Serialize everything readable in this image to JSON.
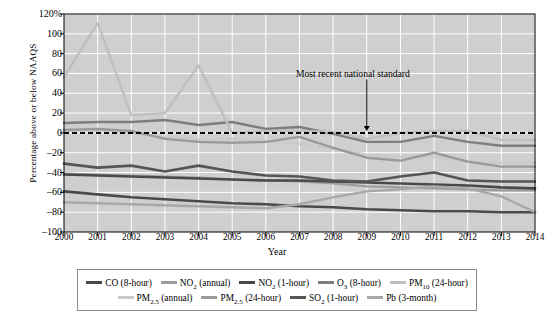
{
  "chart_data": {
    "type": "line",
    "title": "",
    "xlabel": "Year",
    "ylabel": "Percentage above or below NAAQS",
    "x": [
      2000,
      2001,
      2002,
      2003,
      2004,
      2005,
      2006,
      2007,
      2008,
      2009,
      2010,
      2011,
      2012,
      2013,
      2014
    ],
    "xtick_labels": [
      "2000",
      "2001",
      "2002",
      "2003",
      "2004",
      "2005",
      "2006",
      "2007",
      "2008",
      "2009",
      "2010",
      "2011",
      "2012",
      "2013",
      "2014"
    ],
    "ytick_labels": [
      "120%",
      "100",
      "80",
      "60",
      "40",
      "20",
      "0",
      "–20",
      "–40",
      "–60",
      "–80",
      "–100"
    ],
    "ytick_values": [
      120,
      100,
      80,
      60,
      40,
      20,
      0,
      -20,
      -40,
      -60,
      -80,
      -100
    ],
    "ylim": [
      -100,
      120
    ],
    "xlim": [
      2000,
      2014
    ],
    "grid": true,
    "plot_background": "#cfcfcf",
    "legend_position": "below",
    "annotations": [
      {
        "text": "Most recent national standard",
        "arrow_to_x": 2009,
        "arrow_to_y": 0,
        "label_x": 2008.1,
        "label_y": 68
      }
    ],
    "reference_line": {
      "name": "Most recent national standard",
      "y": 0,
      "style": "dashed",
      "color": "#000000"
    },
    "series": [
      {
        "name": "CO (8-hour)",
        "label_html": "CO (8-hour)",
        "color": "#4a4a4a",
        "width": 2.6,
        "values": [
          -59,
          -62,
          -65,
          -67,
          -69,
          -71,
          -72,
          -74,
          -75,
          -77,
          -78,
          -79,
          -79,
          -80,
          -80
        ]
      },
      {
        "name": "NO2 (annual)",
        "label_html": "NO<sub>2</sub> (annual)",
        "color": "#9d9d9d",
        "width": 2.2,
        "values": [
          -41,
          -42,
          -43,
          -44,
          -45,
          -47,
          -48,
          -49,
          -51,
          -54,
          -55,
          -56,
          -57,
          -58,
          -58
        ]
      },
      {
        "name": "NO2 (1-hour)",
        "label_html": "NO<sub>2</sub> (1-hour)",
        "color": "#4a4a4a",
        "width": 2.6,
        "values": [
          -42,
          -43,
          -44,
          -45,
          -46,
          -47,
          -48,
          -48,
          -49,
          -50,
          -51,
          -52,
          -53,
          -55,
          -56
        ]
      },
      {
        "name": "O3 (8-hour)",
        "label_html": "O<sub>3</sub> (8-hour)",
        "color": "#7e7e7e",
        "width": 2.4,
        "values": [
          10,
          11,
          11,
          13,
          8,
          11,
          4,
          6,
          -1,
          -9,
          -9,
          -3,
          -9,
          -13,
          -13
        ]
      },
      {
        "name": "PM10 (24-hour)",
        "label_html": "PM<sub>10</sub> (24-hour)",
        "color": "#bfbfbf",
        "width": 2.4,
        "values": [
          56,
          111,
          18,
          20,
          68,
          0,
          2,
          2,
          1,
          -6,
          0,
          2,
          2,
          -7,
          -7
        ]
      },
      {
        "name": "PM2.5 (annual)",
        "label_html": "PM<sub>2.5</sub> (annual)",
        "color": "#cacaca",
        "width": 2.4,
        "values": [
          2,
          3,
          0,
          -4,
          -7,
          -6,
          -8,
          -11,
          -16,
          -22,
          -24,
          -24,
          -29,
          -30,
          -30
        ]
      },
      {
        "name": "PM2.5 (24-hour)",
        "label_html": "PM<sub>2.5</sub> (24-hour)",
        "color": "#9a9a9a",
        "width": 2.4,
        "values": [
          3,
          4,
          2,
          -6,
          -9,
          -10,
          -9,
          -4,
          -15,
          -25,
          -28,
          -20,
          -29,
          -34,
          -34
        ]
      },
      {
        "name": "SO2 (1-hour)",
        "label_html": "SO<sub>2</sub> (1-hour)",
        "color": "#555555",
        "width": 2.6,
        "values": [
          -31,
          -35,
          -33,
          -39,
          -33,
          -39,
          -43,
          -44,
          -48,
          -49,
          -44,
          -40,
          -48,
          -49,
          -49
        ]
      },
      {
        "name": "Pb (3-month)",
        "label_html": "Pb (3-month)",
        "color": "#a8a8a8",
        "width": 2.4,
        "values": [
          -70,
          -71,
          -72,
          -73,
          -74,
          -75,
          -76,
          -72,
          -65,
          -59,
          -57,
          -54,
          -56,
          -64,
          -80
        ]
      }
    ]
  },
  "legend": {
    "rows": [
      [
        {
          "label_html": "CO (8-hour)",
          "color": "#4a4a4a"
        },
        {
          "label_html": "NO<sub>2</sub> (annual)",
          "color": "#9d9d9d"
        },
        {
          "label_html": "NO<sub>2</sub> (1-hour)",
          "color": "#4a4a4a"
        },
        {
          "label_html": "O<sub>3</sub> (8-hour)",
          "color": "#7e7e7e"
        },
        {
          "label_html": "PM<sub>10</sub> (24-hour)",
          "color": "#bfbfbf"
        }
      ],
      [
        {
          "label_html": "PM<sub>2.5</sub> (annual)",
          "color": "#cacaca"
        },
        {
          "label_html": "PM<sub>2.5</sub> (24-hour)",
          "color": "#9a9a9a"
        },
        {
          "label_html": "SO<sub>2</sub> (1-hour)",
          "color": "#555555"
        },
        {
          "label_html": "Pb (3-month)",
          "color": "#a8a8a8"
        }
      ]
    ]
  }
}
